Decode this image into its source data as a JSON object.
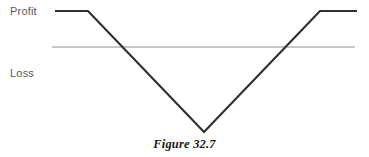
{
  "figure": {
    "caption": "Figure 32.7",
    "background_color": "#ffffff"
  },
  "labels": {
    "profit": "Profit",
    "loss": "Loss",
    "label_color": "#58585a"
  },
  "chart_data": {
    "type": "line",
    "title": "Figure 32.7",
    "xlabel": "",
    "ylabel": "",
    "grid": false,
    "legend": null,
    "annotations": [
      "Profit",
      "Loss"
    ],
    "zero_line": {
      "name": "breakeven-axis",
      "y": 0,
      "x_start": 52,
      "x_end": 355,
      "color": "#b4b4b4",
      "width": 1.3
    },
    "series": [
      {
        "name": "payoff",
        "color": "#2f2f2f",
        "width": 2.2,
        "points": [
          {
            "x": 55,
            "y": 11
          },
          {
            "x": 88,
            "y": 11
          },
          {
            "x": 204,
            "y": 132
          },
          {
            "x": 320,
            "y": 11
          },
          {
            "x": 357,
            "y": 11
          }
        ]
      }
    ],
    "xlim": [
      0,
      369
    ],
    "ylim": [
      157,
      0
    ]
  }
}
